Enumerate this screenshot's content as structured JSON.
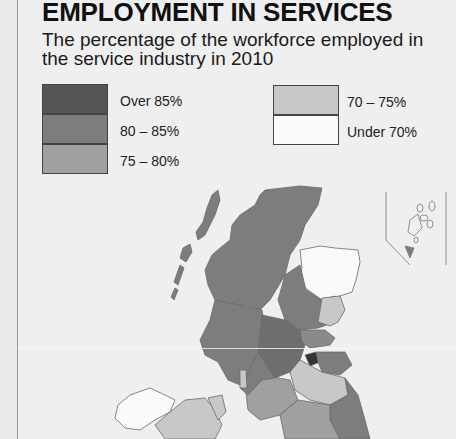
{
  "header": {
    "title": "EMPLOYMENT IN SERVICES",
    "subtitle": "The percentage of the workforce employed in the service industry in 2010"
  },
  "legend": {
    "items": [
      {
        "label": "Over 85%",
        "color": "#555555"
      },
      {
        "label": "80 – 85%",
        "color": "#7d7d7d"
      },
      {
        "label": "75 – 80%",
        "color": "#a0a0a0"
      },
      {
        "label": "70 – 75%",
        "color": "#c8c8c8"
      },
      {
        "label": "Under 70%",
        "color": "#fafafa"
      }
    ]
  },
  "map": {
    "region": "United Kingdom and Ireland (northern part shown)",
    "inset": "Shetland Islands inset",
    "category_colors": {
      "over_85": "#555555",
      "80_85": "#7d7d7d",
      "75_80": "#a0a0a0",
      "70_75": "#c8c8c8",
      "under_70": "#fafafa"
    }
  }
}
